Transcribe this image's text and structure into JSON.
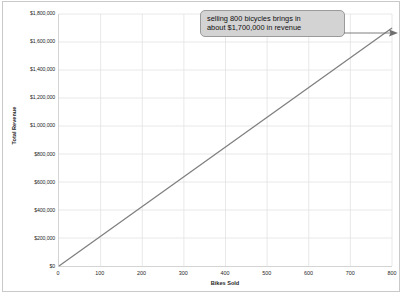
{
  "chart_data": {
    "type": "line",
    "title": "",
    "xlabel": "Bikes Sold",
    "ylabel": "Total Revenue",
    "xlim": [
      0,
      800
    ],
    "ylim": [
      0,
      1800000
    ],
    "grid": true,
    "legend": "none",
    "line_color": "#808080",
    "x_ticks": [
      "0",
      "100",
      "200",
      "300",
      "400",
      "500",
      "600",
      "700",
      "800"
    ],
    "x_tick_values": [
      0,
      100,
      200,
      300,
      400,
      500,
      600,
      700,
      800
    ],
    "y_ticks": [
      "$0",
      "$200,000",
      "$400,000",
      "$600,000",
      "$800,000",
      "$1,000,000",
      "$1,200,000",
      "$1,400,000",
      "$1,600,000",
      "$1,800,000"
    ],
    "y_tick_values": [
      0,
      200000,
      400000,
      600000,
      800000,
      1000000,
      1200000,
      1400000,
      1600000,
      1800000
    ],
    "series": [
      {
        "name": "Total Revenue",
        "x": [
          0,
          800
        ],
        "values": [
          0,
          1700000
        ]
      }
    ],
    "annotations": [
      {
        "name": "revenue-callout",
        "line1": "selling 800 bicycles brings in",
        "line2": "about $1,700,000 in revenue",
        "points_to_x": 800,
        "points_to_y": 1700000
      }
    ]
  },
  "footer": {
    "note": ""
  }
}
